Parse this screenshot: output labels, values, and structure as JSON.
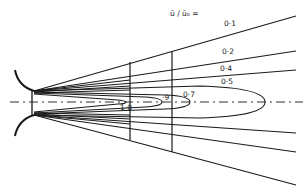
{
  "diagram": {
    "title": "ū / ū₀ =",
    "contours": [
      {
        "label": "0·1"
      },
      {
        "label": "0·2"
      },
      {
        "label": "0·4"
      },
      {
        "label": "0·5"
      },
      {
        "label": "0·7"
      },
      {
        "label": "·9"
      },
      {
        "label": "1·0"
      }
    ],
    "colors": {
      "line": "#1a1a1a",
      "background": "#ffffff"
    }
  }
}
